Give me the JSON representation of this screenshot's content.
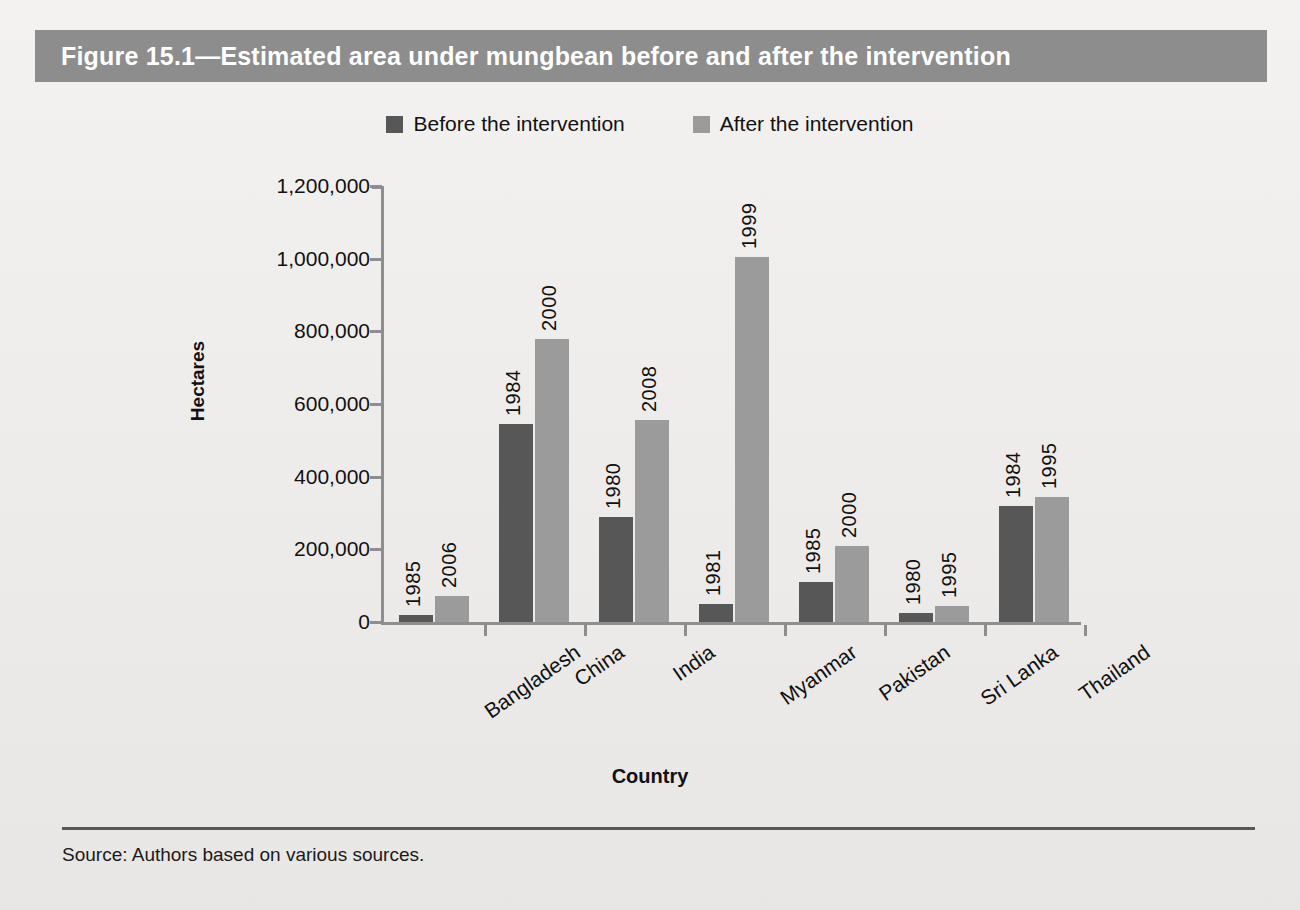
{
  "figure": {
    "title": "Figure 15.1—Estimated area under mungbean before and after the intervention",
    "source_note": "Source: Authors based on various sources."
  },
  "colors": {
    "header_band": "#8d8d8d",
    "page_background": "#edebe9",
    "before_series": "#575757",
    "after_series": "#9b9b9b",
    "axis": "#8e8e8e",
    "text": "#111111"
  },
  "legend": {
    "position": "top-center",
    "items": [
      {
        "label": "Before the intervention",
        "color": "#575757"
      },
      {
        "label": "After the intervention",
        "color": "#9b9b9b"
      }
    ]
  },
  "chart_data": {
    "type": "bar",
    "title": "Figure 15.1—Estimated area under mungbean before and after the intervention",
    "xlabel": "Country",
    "ylabel": "Hectares",
    "ylim": [
      0,
      1200000
    ],
    "ytick_labels": [
      "0",
      "200,000",
      "400,000",
      "600,000",
      "800,000",
      "1,000,000",
      "1,200,000"
    ],
    "ytick_values": [
      0,
      200000,
      400000,
      600000,
      800000,
      1000000,
      1200000
    ],
    "grid": false,
    "legend_position": "top-center",
    "categories": [
      "Bangladesh",
      "China",
      "India",
      "Myanmar",
      "Pakistan",
      "Sri Lanka",
      "Thailand"
    ],
    "series": [
      {
        "name": "Before the intervention",
        "color": "#575757",
        "values": [
          20000,
          545000,
          290000,
          50000,
          110000,
          25000,
          318000
        ],
        "point_labels": [
          "1985",
          "1984",
          "1980",
          "1981",
          "1985",
          "1980",
          "1984"
        ]
      },
      {
        "name": "After the intervention",
        "color": "#9b9b9b",
        "values": [
          72000,
          778000,
          557000,
          1005000,
          210000,
          45000,
          345000
        ],
        "point_labels": [
          "2006",
          "2000",
          "2008",
          "1999",
          "2000",
          "1995",
          "1995"
        ]
      }
    ]
  }
}
